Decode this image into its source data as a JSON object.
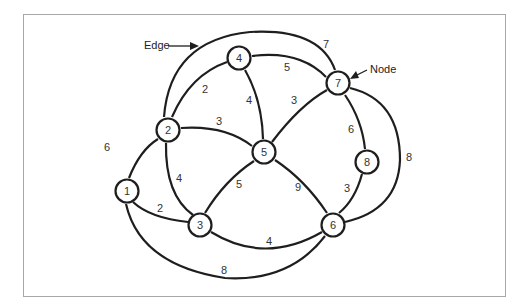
{
  "diagram": {
    "type": "weighted-undirected-graph",
    "callouts": {
      "edge_label": "Edge",
      "node_label": "Node"
    },
    "nodes": [
      {
        "id": "1",
        "label": "1",
        "x": 127,
        "y": 191
      },
      {
        "id": "2",
        "label": "2",
        "x": 168,
        "y": 130
      },
      {
        "id": "3",
        "label": "3",
        "x": 200,
        "y": 225
      },
      {
        "id": "4",
        "label": "4",
        "x": 239,
        "y": 58
      },
      {
        "id": "5",
        "label": "5",
        "x": 264,
        "y": 152
      },
      {
        "id": "6",
        "label": "6",
        "x": 333,
        "y": 225
      },
      {
        "id": "7",
        "label": "7",
        "x": 338,
        "y": 83
      },
      {
        "id": "8",
        "label": "8",
        "x": 367,
        "y": 162
      }
    ],
    "edges": [
      {
        "from": "1",
        "to": "2",
        "weight": "6"
      },
      {
        "from": "1",
        "to": "3",
        "weight": "2"
      },
      {
        "from": "1",
        "to": "6",
        "weight": "8"
      },
      {
        "from": "2",
        "to": "3",
        "weight": "4"
      },
      {
        "from": "2",
        "to": "4",
        "weight": "2"
      },
      {
        "from": "2",
        "to": "5",
        "weight": "3"
      },
      {
        "from": "2",
        "to": "7",
        "weight": "7"
      },
      {
        "from": "3",
        "to": "5",
        "weight": "5"
      },
      {
        "from": "3",
        "to": "6",
        "weight": "4"
      },
      {
        "from": "4",
        "to": "5",
        "weight": "4"
      },
      {
        "from": "4",
        "to": "7",
        "weight": "5"
      },
      {
        "from": "5",
        "to": "7",
        "weight": "3"
      },
      {
        "from": "5",
        "to": "6",
        "weight": "9"
      },
      {
        "from": "7",
        "to": "8",
        "weight": "6"
      },
      {
        "from": "8",
        "to": "6",
        "weight": "3"
      },
      {
        "from": "7",
        "to": "6",
        "weight": "8"
      }
    ]
  }
}
